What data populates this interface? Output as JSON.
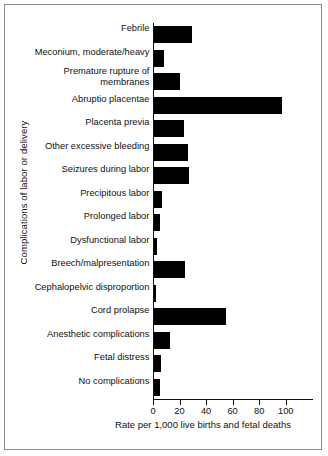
{
  "chart_data": {
    "type": "bar",
    "orientation": "horizontal",
    "title": "",
    "xlabel": "Rate per 1,000 live births and fetal deaths",
    "ylabel": "Complications of labor or delivery",
    "xlim": [
      0,
      110
    ],
    "xticks": [
      0,
      20,
      40,
      60,
      80,
      100
    ],
    "xtick_labels": [
      "0",
      "20",
      "40",
      "60",
      "80",
      "100"
    ],
    "grid": false,
    "legend": null,
    "bar_color": "#000000",
    "categories": [
      "Febrile",
      "Meconium, moderate/heavy",
      "Premature rupture of\nmembranes",
      "Abruptio placentae",
      "Placenta previa",
      "Other excessive bleeding",
      "Seizures during labor",
      "Precipitous labor",
      "Prolonged labor",
      "Dysfunctional labor",
      "Breech/malpresentation",
      "Cephalopelvic disproportion",
      "Cord prolapse",
      "Anesthetic complications",
      "Fetal distress",
      "No complications"
    ],
    "values": [
      28,
      7.5,
      19,
      96,
      22.5,
      25,
      26,
      6,
      4.5,
      2,
      23,
      1,
      54,
      11.5,
      5,
      4
    ]
  }
}
